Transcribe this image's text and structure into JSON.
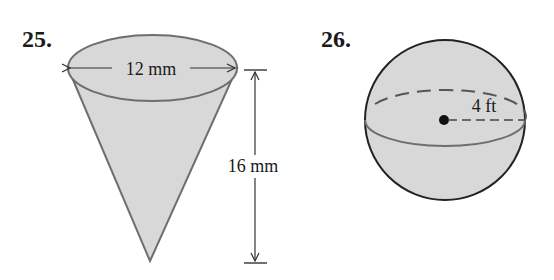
{
  "problems": [
    {
      "number": "25.",
      "shape": "cone",
      "diameter_label": "12 mm",
      "height_label": "16 mm"
    },
    {
      "number": "26.",
      "shape": "sphere",
      "radius_label": "4 ft"
    }
  ],
  "colors": {
    "fill": "#d6d6d6",
    "outline": "#6a6a6a",
    "text": "#1a1a1a"
  }
}
